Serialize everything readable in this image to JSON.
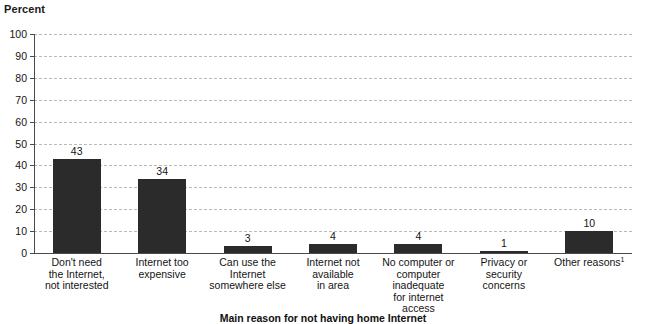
{
  "chart_data": {
    "type": "bar",
    "title": "",
    "unit_label": "Percent",
    "xlabel": "Main reason for not having home Internet",
    "ylabel": "Percent",
    "ylim": [
      0,
      100
    ],
    "y_ticks": [
      0,
      10,
      20,
      30,
      40,
      50,
      60,
      70,
      80,
      90,
      100
    ],
    "grid": true,
    "legend": "none",
    "categories": [
      "Don't need the Internet, not interested",
      "Internet too expensive",
      "Can use the Internet somewhere else",
      "Internet not available in area",
      "No computer or computer inadequate for internet access",
      "Privacy or security concerns",
      "Other reasons"
    ],
    "category_lines": [
      [
        "Don't need",
        "the Internet,",
        "not interested"
      ],
      [
        "Internet too",
        "expensive"
      ],
      [
        "Can use the",
        "Internet",
        "somewhere else"
      ],
      [
        "Internet not",
        "available",
        "in area"
      ],
      [
        "No computer or",
        "computer inadequate",
        "for internet access"
      ],
      [
        "Privacy or",
        "security",
        "concerns"
      ],
      [
        "Other reasons"
      ]
    ],
    "category_footnotes": [
      "",
      "",
      "",
      "",
      "",
      "",
      "1"
    ],
    "values": [
      43,
      34,
      3,
      4,
      4,
      1,
      10
    ],
    "value_labels": [
      "43",
      "34",
      "3",
      "4",
      "4",
      "1",
      "10"
    ],
    "bar_color": "#2b2b2b",
    "gridline_color": "#b9b9b9",
    "axis_color": "#4a4a4a"
  }
}
